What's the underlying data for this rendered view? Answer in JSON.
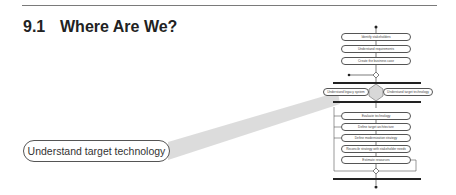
{
  "section": {
    "number": "9.1",
    "title": "Where Are We?"
  },
  "callout": {
    "label": "Understand target technology"
  },
  "diagram": {
    "top_activities": [
      "Identify stakeholders",
      "Understand requirements",
      "Create the business case"
    ],
    "parallel_activities": [
      "Understand legacy system",
      "Understand target technology"
    ],
    "lower_activities": [
      "Evaluate technology",
      "Define target architecture",
      "Define modernization strategy",
      "Reconcile strategy with stakeholder needs",
      "Estimate resources"
    ],
    "highlight_color": "#cfcfcf"
  }
}
